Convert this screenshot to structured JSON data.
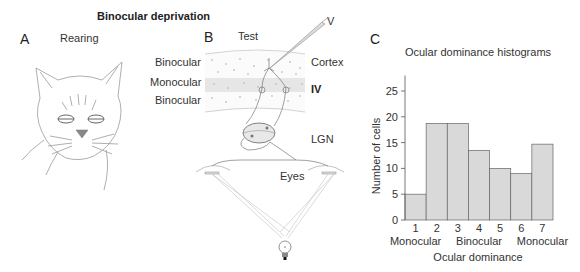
{
  "figure": {
    "title": "Binocular deprivation",
    "panel_a": {
      "letter": "A",
      "label": "Rearing",
      "image": "cat-face-with-both-eyes-closed"
    },
    "panel_b": {
      "letter": "B",
      "label": "Test",
      "electrode_label": "V",
      "layer_labels": [
        "Binocular",
        "Monocular",
        "Binocular"
      ],
      "region_labels": {
        "cortex": "Cortex",
        "layer": "IV",
        "lgn": "LGN",
        "eyes": "Eyes"
      }
    },
    "panel_c": {
      "letter": "C"
    }
  },
  "chart_data": {
    "type": "bar",
    "title": "Ocular dominance histograms",
    "xlabel": "Ocular dominance",
    "ylabel": "Number of cells",
    "categories": [
      "1",
      "2",
      "3",
      "4",
      "5",
      "6",
      "7"
    ],
    "values": [
      5,
      18.7,
      18.7,
      13.5,
      10,
      9,
      14.7
    ],
    "ylim": [
      0,
      28
    ],
    "yticks": [
      0,
      5,
      10,
      15,
      20,
      25
    ],
    "x_group_labels": [
      "Monocular",
      "Binocular",
      "Monocular"
    ],
    "bar_color": "#d9d9d9",
    "edge_color": "#666666",
    "grid": false
  }
}
